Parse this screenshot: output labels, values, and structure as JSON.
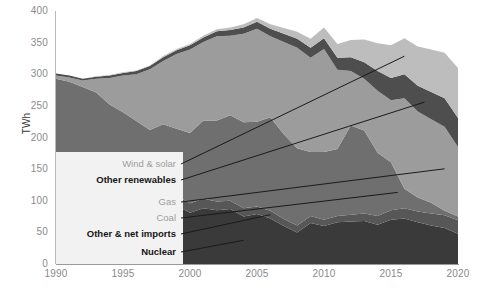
{
  "chart_data": {
    "type": "area",
    "stacked": true,
    "title": "",
    "xlabel": "",
    "ylabel": "TWh",
    "xlim": [
      1990,
      2020
    ],
    "ylim": [
      0,
      400
    ],
    "ytick_labels": [
      "0",
      "50",
      "100",
      "150",
      "200",
      "250",
      "300",
      "350",
      "400"
    ],
    "ytick_values": [
      0,
      50,
      100,
      150,
      200,
      250,
      300,
      350,
      400
    ],
    "xtick_labels": [
      "1990",
      "1995",
      "2000",
      "2005",
      "2010",
      "2015",
      "2020"
    ],
    "xtick_values": [
      1990,
      1995,
      2000,
      2005,
      2010,
      2015,
      2020
    ],
    "grid": false,
    "legend_position": "inside-lower-left",
    "x": [
      1990,
      1991,
      1992,
      1993,
      1994,
      1995,
      1996,
      1997,
      1998,
      1999,
      2000,
      2001,
      2002,
      2003,
      2004,
      2005,
      2006,
      2007,
      2008,
      2009,
      2010,
      2011,
      2012,
      2013,
      2014,
      2015,
      2016,
      2017,
      2018,
      2019,
      2020
    ],
    "series": [
      {
        "name": "Nuclear",
        "color": "#3a3a3a",
        "values": [
          64,
          65,
          69,
          83,
          85,
          85,
          89,
          92,
          93,
          92,
          81,
          88,
          85,
          87,
          75,
          79,
          72,
          60,
          50,
          65,
          60,
          66,
          67,
          68,
          62,
          70,
          72,
          66,
          61,
          57,
          48
        ]
      },
      {
        "name": "Other & net imports",
        "color": "#575757",
        "values": [
          21,
          20,
          19,
          18,
          17,
          16,
          16,
          16,
          16,
          16,
          15,
          15,
          14,
          13,
          13,
          12,
          12,
          11,
          11,
          11,
          10,
          10,
          11,
          12,
          14,
          15,
          16,
          17,
          19,
          20,
          21
        ]
      },
      {
        "name": "Coal",
        "color": "#6f6f6f",
        "values": [
          208,
          203,
          192,
          170,
          150,
          139,
          121,
          104,
          112,
          106,
          111,
          124,
          128,
          135,
          136,
          134,
          148,
          134,
          122,
          101,
          107,
          106,
          141,
          131,
          100,
          76,
          31,
          22,
          17,
          7,
          6
        ]
      },
      {
        "name": "Gas",
        "color": "#9c9c9c",
        "values": [
          5,
          7,
          10,
          22,
          42,
          58,
          74,
          96,
          100,
          118,
          132,
          124,
          133,
          126,
          140,
          147,
          128,
          146,
          159,
          149,
          163,
          125,
          86,
          82,
          98,
          98,
          143,
          136,
          132,
          133,
          110
        ]
      },
      {
        "name": "Other renewables",
        "color": "#4e4e4e",
        "values": [
          3,
          3,
          3,
          3,
          4,
          4,
          5,
          5,
          6,
          6,
          7,
          7,
          8,
          9,
          10,
          11,
          12,
          13,
          14,
          16,
          17,
          19,
          22,
          26,
          31,
          35,
          38,
          41,
          43,
          45,
          46
        ]
      },
      {
        "name": "Wind & solar",
        "color": "#bdbdbd",
        "values": [
          0,
          0,
          0,
          1,
          1,
          1,
          1,
          1,
          2,
          2,
          2,
          3,
          3,
          4,
          5,
          6,
          7,
          9,
          11,
          14,
          17,
          22,
          27,
          36,
          44,
          52,
          57,
          62,
          67,
          72,
          79
        ]
      }
    ]
  },
  "legend": {
    "items": [
      {
        "label": "Wind & solar",
        "style": "muted"
      },
      {
        "label": "Other renewables",
        "style": "strong"
      },
      {
        "label": "Gas",
        "style": "muted"
      },
      {
        "label": "Coal",
        "style": "muted"
      },
      {
        "label": "Other & net imports",
        "style": "strong"
      },
      {
        "label": "Nuclear",
        "style": "strong"
      }
    ]
  }
}
